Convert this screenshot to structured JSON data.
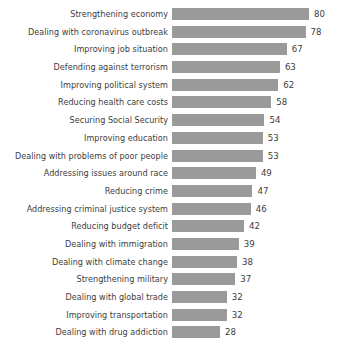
{
  "chart_data": {
    "type": "bar",
    "title": "",
    "subtitle": "",
    "xlabel": "",
    "ylabel": "",
    "orientation": "horizontal",
    "grid": false,
    "legend": null,
    "xlim": [
      0,
      80
    ],
    "value_labels": true,
    "bar_color": "#9a9a9a",
    "text_color": "#3d3d3d",
    "background_color": "#ffffff",
    "categories": [
      "Strengthening economy",
      "Dealing with coronavirus outbreak",
      "Improving job situation",
      "Defending against terrorism",
      "Improving political system",
      "Reducing health care costs",
      "Securing Social Security",
      "Improving education",
      "Dealing with problems of poor people",
      "Addressing issues around race",
      "Reducing crime",
      "Addressing criminal justice system",
      "Reducing budget deficit",
      "Dealing with immigration",
      "Dealing with climate change",
      "Strengthening military",
      "Dealing with global trade",
      "Improving transportation",
      "Dealing with drug addiction"
    ],
    "values": [
      80,
      78,
      67,
      63,
      62,
      58,
      54,
      53,
      53,
      49,
      47,
      46,
      42,
      39,
      38,
      37,
      32,
      32,
      28
    ],
    "value_strings": [
      "80",
      "78",
      "67",
      "63",
      "62",
      "58",
      "54",
      "53",
      "53",
      "49",
      "47",
      "46",
      "42",
      "39",
      "38",
      "37",
      "32",
      "32",
      "28"
    ]
  }
}
